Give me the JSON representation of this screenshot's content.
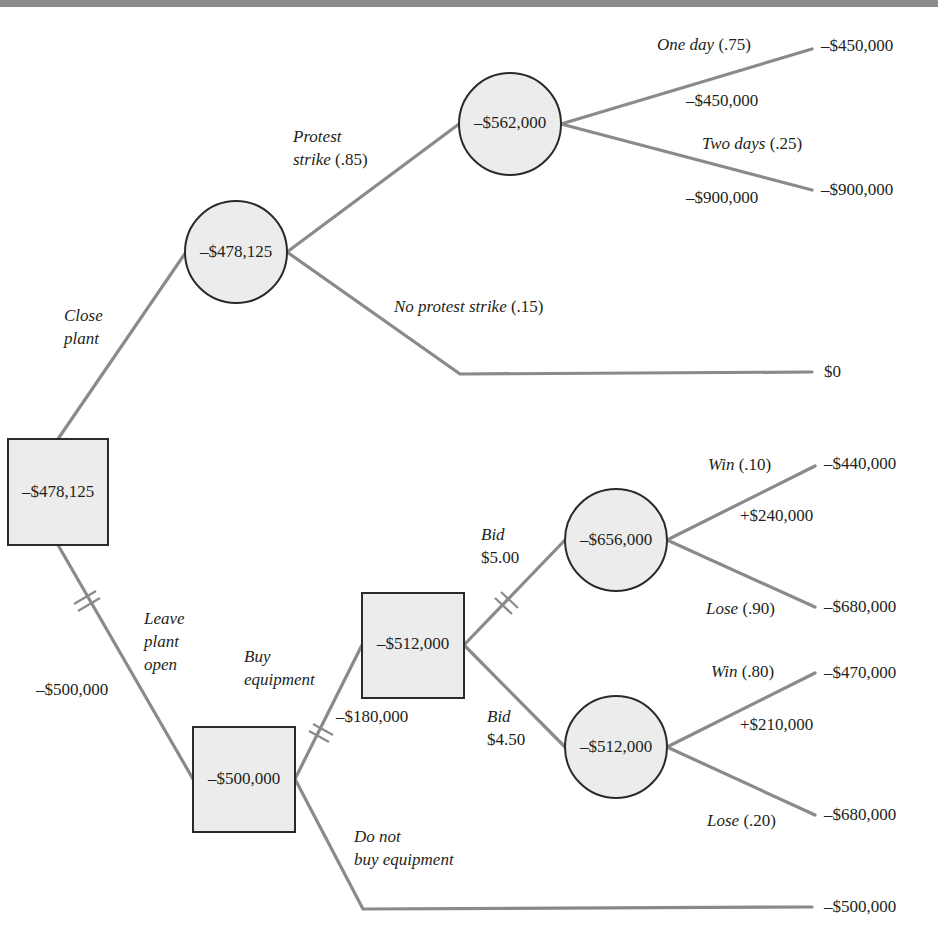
{
  "title_bar": {
    "color": "#8c8c8c"
  },
  "colors": {
    "edge": "#8a8a8a",
    "node_fill": "#ececec",
    "node_stroke": "#2a2a2a",
    "text": "#231f20"
  },
  "nodes": {
    "root": {
      "type": "decision",
      "value": "–$478,125"
    },
    "close_chance": {
      "type": "chance",
      "value": "–$478,125"
    },
    "strike_chance": {
      "type": "chance",
      "value": "–$562,000"
    },
    "open_decision": {
      "type": "decision",
      "value": "–$500,000"
    },
    "bid_decision": {
      "type": "decision",
      "value": "–$512,000"
    },
    "bid500_chance": {
      "type": "chance",
      "value": "–$656,000"
    },
    "bid450_chance": {
      "type": "chance",
      "value": "–$512,000"
    }
  },
  "branches": {
    "close_plant": {
      "line1": "Close",
      "line2": "plant"
    },
    "leave_open": {
      "line1": "Leave",
      "line2": "plant",
      "line3": "open",
      "cost": "–$500,000"
    },
    "protest_strike": {
      "line1": "Protest",
      "line2_italic": "strike",
      "line2_prob": " (.85)"
    },
    "no_protest": {
      "label": "No protest strike",
      "prob": " (.15)"
    },
    "one_day": {
      "label": "One day",
      "prob": " (.75)",
      "cost": "–$450,000"
    },
    "two_days": {
      "label": "Two days",
      "prob": " (.25)",
      "cost": "–$900,000"
    },
    "buy_equipment": {
      "line1": "Buy",
      "line2": "equipment",
      "cost": "–$180,000"
    },
    "do_not_buy": {
      "line1": "Do not",
      "line2": "buy equipment"
    },
    "bid_500": {
      "line1": "Bid",
      "line2": "$5.00"
    },
    "bid_450": {
      "line1": "Bid",
      "line2": "$4.50"
    },
    "win_10": {
      "label": "Win",
      "prob": " (.10)",
      "gain": "+$240,000"
    },
    "lose_90": {
      "label": "Lose",
      "prob": " (.90)"
    },
    "win_80": {
      "label": "Win",
      "prob": " (.80)",
      "gain": "+$210,000"
    },
    "lose_20": {
      "label": "Lose",
      "prob": " (.20)"
    }
  },
  "outcomes": {
    "one_day": "–$450,000",
    "two_days": "–$900,000",
    "no_strike": "$0",
    "win_10": "–$440,000",
    "lose_90": "–$680,000",
    "win_80": "–$470,000",
    "lose_20": "–$680,000",
    "no_buy": "–$500,000"
  }
}
